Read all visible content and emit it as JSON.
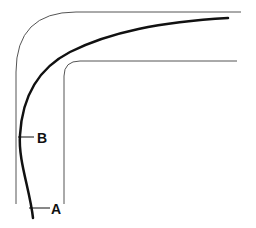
{
  "diagram": {
    "colors": {
      "wall": "#555555",
      "path": "#111111",
      "background": "#ffffff"
    },
    "labels": [
      {
        "id": "B",
        "text": "B"
      },
      {
        "id": "A",
        "text": "A"
      }
    ]
  }
}
